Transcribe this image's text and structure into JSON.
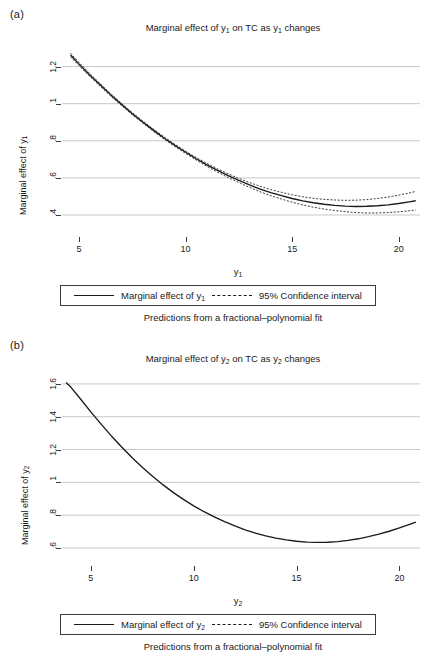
{
  "figure": {
    "background": "#ffffff",
    "line_color": "#1a1a1a",
    "grid_color": "#b9b9b9"
  },
  "panels": [
    {
      "letter": "(a)",
      "title_prefix": "Marginal effect of y",
      "title_sub": "1",
      "title_mid": " on TC as y",
      "title_suffix": " changes",
      "title_full": "Marginal effect of y1 on TC as y1 changes",
      "ylabel_prefix": "Marginal effect of y",
      "ylabel_sub": "1",
      "xlabel_prefix": "y",
      "xlabel_sub": "1",
      "legend": {
        "series_prefix": "Marginal effect of y",
        "series_sub": "1",
        "ci_label": "95% Confidence interval"
      },
      "footnote": "Predictions from a fractional–polynomial fit"
    },
    {
      "letter": "(b)",
      "title_prefix": "Marginal effect of y",
      "title_sub": "2",
      "title_mid": " on TC as y",
      "title_suffix": " changes",
      "title_full": "Marginal effect of y2 on TC as y2 changes",
      "ylabel_prefix": "Marginal effect of y",
      "ylabel_sub": "2",
      "xlabel_prefix": "y",
      "xlabel_sub": "2",
      "legend": {
        "series_prefix": "Marginal effect of y",
        "series_sub": "2",
        "ci_label": "95% Confidence interval"
      },
      "footnote": "Predictions from a fractional–polynomial fit"
    }
  ],
  "chart_data": [
    {
      "panel": "(a)",
      "type": "line",
      "title": "Marginal effect of y1 on TC as y1 changes",
      "xlabel": "y1",
      "ylabel": "Marginal effect of y1",
      "xlim": [
        4.2,
        21.0
      ],
      "ylim": [
        0.33,
        1.3
      ],
      "xticks": [
        5,
        10,
        15,
        20
      ],
      "xtick_labels": [
        "5",
        "10",
        "15",
        "20"
      ],
      "yticks": [
        0.4,
        0.6,
        0.8,
        1.0,
        1.2
      ],
      "ytick_labels": [
        ".4",
        ".6",
        ".8",
        "1",
        "1.2"
      ],
      "grid": "horizontal",
      "legend_position": "below-axis",
      "series": [
        {
          "name": "Marginal effect of y1",
          "style": "solid",
          "x": [
            4.6,
            5.0,
            5.5,
            6.0,
            6.5,
            7.0,
            7.5,
            8.0,
            8.5,
            9.0,
            9.5,
            10.0,
            10.5,
            11.0,
            11.5,
            12.0,
            12.5,
            13.0,
            13.5,
            14.0,
            14.5,
            15.0,
            15.5,
            16.0,
            16.5,
            17.0,
            17.5,
            18.0,
            18.5,
            19.0,
            19.5,
            20.0,
            20.5,
            20.8
          ],
          "values": [
            1.262,
            1.213,
            1.155,
            1.1,
            1.046,
            0.995,
            0.946,
            0.9,
            0.856,
            0.814,
            0.775,
            0.738,
            0.703,
            0.67,
            0.64,
            0.612,
            0.586,
            0.562,
            0.54,
            0.521,
            0.504,
            0.489,
            0.476,
            0.466,
            0.458,
            0.452,
            0.448,
            0.446,
            0.447,
            0.45,
            0.455,
            0.462,
            0.471,
            0.477
          ]
        },
        {
          "name": "95% Confidence interval upper",
          "style": "dashed",
          "x": [
            4.6,
            5.0,
            5.5,
            6.0,
            6.5,
            7.0,
            7.5,
            8.0,
            8.5,
            9.0,
            9.5,
            10.0,
            10.5,
            11.0,
            11.5,
            12.0,
            12.5,
            13.0,
            13.5,
            14.0,
            14.5,
            15.0,
            15.5,
            16.0,
            16.5,
            17.0,
            17.5,
            18.0,
            18.5,
            19.0,
            19.5,
            20.0,
            20.5,
            20.8
          ],
          "values": [
            1.272,
            1.222,
            1.163,
            1.107,
            1.053,
            1.001,
            0.952,
            0.906,
            0.862,
            0.82,
            0.781,
            0.744,
            0.71,
            0.678,
            0.649,
            0.622,
            0.597,
            0.575,
            0.555,
            0.537,
            0.522,
            0.509,
            0.498,
            0.49,
            0.484,
            0.481,
            0.479,
            0.48,
            0.483,
            0.489,
            0.497,
            0.507,
            0.519,
            0.527
          ]
        },
        {
          "name": "95% Confidence interval lower",
          "style": "dashed",
          "x": [
            4.6,
            5.0,
            5.5,
            6.0,
            6.5,
            7.0,
            7.5,
            8.0,
            8.5,
            9.0,
            9.5,
            10.0,
            10.5,
            11.0,
            11.5,
            12.0,
            12.5,
            13.0,
            13.5,
            14.0,
            14.5,
            15.0,
            15.5,
            16.0,
            16.5,
            17.0,
            17.5,
            18.0,
            18.5,
            19.0,
            19.5,
            20.0,
            20.5,
            20.8
          ],
          "values": [
            1.252,
            1.204,
            1.147,
            1.093,
            1.039,
            0.989,
            0.94,
            0.894,
            0.85,
            0.808,
            0.769,
            0.732,
            0.696,
            0.662,
            0.631,
            0.602,
            0.575,
            0.549,
            0.525,
            0.504,
            0.486,
            0.469,
            0.454,
            0.442,
            0.432,
            0.424,
            0.418,
            0.413,
            0.411,
            0.411,
            0.413,
            0.417,
            0.423,
            0.427
          ]
        }
      ]
    },
    {
      "panel": "(b)",
      "type": "line",
      "title": "Marginal effect of y2 on TC as y2 changes",
      "xlabel": "y2",
      "ylabel": "Marginal effect of y2",
      "xlim": [
        3.6,
        21.0
      ],
      "ylim": [
        0.545,
        1.63
      ],
      "xticks": [
        5,
        10,
        15,
        20
      ],
      "xtick_labels": [
        "5",
        "10",
        "15",
        "20"
      ],
      "yticks": [
        0.6,
        0.8,
        1.0,
        1.2,
        1.4,
        1.6
      ],
      "ytick_labels": [
        ".6",
        ".8",
        "1",
        "1.2",
        "1.4",
        "1.6"
      ],
      "grid": "horizontal",
      "legend_position": "below-axis",
      "series": [
        {
          "name": "Marginal effect of y2",
          "style": "solid",
          "x": [
            3.8,
            4.0,
            4.5,
            5.0,
            5.5,
            6.0,
            6.5,
            7.0,
            7.5,
            8.0,
            8.5,
            9.0,
            9.5,
            10.0,
            10.5,
            11.0,
            11.5,
            12.0,
            12.5,
            13.0,
            13.5,
            14.0,
            14.5,
            15.0,
            15.5,
            16.0,
            16.5,
            17.0,
            17.5,
            18.0,
            18.5,
            19.0,
            19.5,
            20.0,
            20.5,
            20.8
          ],
          "values": [
            1.608,
            1.585,
            1.508,
            1.43,
            1.355,
            1.283,
            1.215,
            1.151,
            1.092,
            1.037,
            0.986,
            0.939,
            0.896,
            0.857,
            0.821,
            0.789,
            0.76,
            0.734,
            0.711,
            0.691,
            0.674,
            0.66,
            0.649,
            0.641,
            0.636,
            0.634,
            0.635,
            0.639,
            0.646,
            0.656,
            0.669,
            0.684,
            0.702,
            0.722,
            0.744,
            0.758
          ]
        },
        {
          "name": "95% Confidence interval",
          "style": "dashed",
          "note": "bands coincide with fitted line at this resolution",
          "x": [
            3.8,
            20.8
          ],
          "values": [
            1.608,
            0.758
          ]
        }
      ]
    }
  ]
}
